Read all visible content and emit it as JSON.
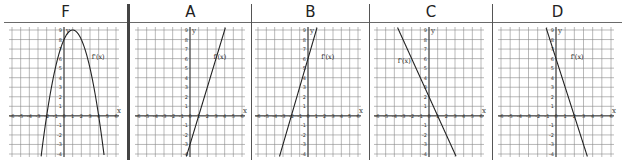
{
  "columns": [
    {
      "id": "F",
      "title": "F",
      "label": "f'(x)",
      "type": "parabola",
      "expr": "-(x-1)^2+9"
    },
    {
      "id": "A",
      "title": "A",
      "label": "f'(x)",
      "type": "line",
      "expr": "3x-3"
    },
    {
      "id": "B",
      "title": "B",
      "label": "f'(x)",
      "type": "line",
      "expr": "3x+6"
    },
    {
      "id": "C",
      "title": "C",
      "label": "f'(x)",
      "type": "line",
      "expr": "-2x+2"
    },
    {
      "id": "D",
      "title": "D",
      "label": "f'(x)",
      "type": "line",
      "expr": "-3x+6"
    }
  ],
  "axes": {
    "x_label": "x",
    "y_label": "y",
    "x_ticks": [
      -6,
      -5,
      -4,
      -3,
      -2,
      -1,
      0,
      1,
      2,
      3,
      4,
      5,
      6
    ],
    "y_ticks": [
      -4,
      -3,
      -2,
      -1,
      1,
      2,
      3,
      4,
      5,
      6,
      7,
      8,
      9
    ]
  },
  "chart_data": [
    {
      "type": "line",
      "title": "F",
      "series": [
        {
          "name": "f'(x)",
          "formula": "-(x-1)^2+9",
          "vertex": [
            1,
            9
          ],
          "roots": [
            -2,
            4
          ]
        }
      ],
      "xlim": [
        -6,
        6
      ],
      "ylim": [
        -4,
        9
      ],
      "grid": true
    },
    {
      "type": "line",
      "title": "A",
      "series": [
        {
          "name": "f'(x)",
          "formula": "3x-3",
          "y_intercept": -3,
          "root": 1
        }
      ],
      "xlim": [
        -6,
        6
      ],
      "ylim": [
        -4,
        9
      ],
      "grid": true
    },
    {
      "type": "line",
      "title": "B",
      "series": [
        {
          "name": "f'(x)",
          "formula": "3x+6",
          "y_intercept": 6,
          "root": -2
        }
      ],
      "xlim": [
        -6,
        6
      ],
      "ylim": [
        -4,
        9
      ],
      "grid": true
    },
    {
      "type": "line",
      "title": "C",
      "series": [
        {
          "name": "f'(x)",
          "formula": "-2x+2",
          "y_intercept": 2,
          "root": 1
        }
      ],
      "xlim": [
        -6,
        6
      ],
      "ylim": [
        -4,
        9
      ],
      "grid": true
    },
    {
      "type": "line",
      "title": "D",
      "series": [
        {
          "name": "f'(x)",
          "formula": "-3x+6",
          "y_intercept": 6,
          "root": 2
        }
      ],
      "xlim": [
        -6,
        6
      ],
      "ylim": [
        -4,
        9
      ],
      "grid": true
    }
  ]
}
